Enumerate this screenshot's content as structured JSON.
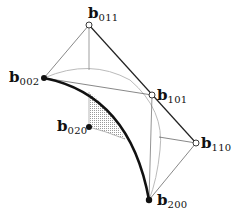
{
  "diagram": {
    "title": "",
    "points": [
      {
        "id": "b011",
        "base": "b",
        "sub": "011",
        "x": 89,
        "y": 25,
        "style": "open"
      },
      {
        "id": "b002",
        "base": "b",
        "sub": "002",
        "x": 44,
        "y": 78,
        "style": "filled"
      },
      {
        "id": "b101",
        "base": "b",
        "sub": "101",
        "x": 152,
        "y": 95,
        "style": "open"
      },
      {
        "id": "b110",
        "base": "b",
        "sub": "110",
        "x": 196,
        "y": 143,
        "style": "open"
      },
      {
        "id": "b200",
        "base": "b",
        "sub": "200",
        "x": 149,
        "y": 200,
        "style": "filled"
      },
      {
        "id": "b020",
        "base": "b",
        "sub": "020",
        "x": 89,
        "y": 127,
        "style": "filled"
      }
    ],
    "labels": {
      "b011": {
        "base": "b",
        "sub": "011"
      },
      "b002": {
        "base": "b",
        "sub": "002"
      },
      "b101": {
        "base": "b",
        "sub": "101"
      },
      "b110": {
        "base": "b",
        "sub": "110"
      },
      "b200": {
        "base": "b",
        "sub": "200"
      },
      "b020": {
        "base": "b",
        "sub": "020"
      }
    },
    "colors": {
      "thick_curve": "#111111",
      "thin_line": "#555555",
      "gray_arc": "#bbbbbb",
      "shade": "#cfcfcf"
    }
  }
}
